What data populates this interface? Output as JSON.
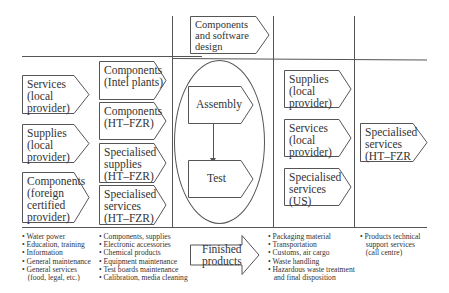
{
  "top": {
    "design_box": "Components\nand software\ndesign"
  },
  "left_column": {
    "boxes": [
      "Services\n(local\nprovider)",
      "Supplies\n(local\nprovider)",
      "Components\n(foreign\ncertified\nprovider)"
    ],
    "list": [
      "• Water power",
      "• Education, training",
      "• Information",
      "• General maintenance",
      "• General services",
      "   (food, legal, etc.)"
    ]
  },
  "second_column": {
    "boxes": [
      "Components\n(Intel plants)",
      "Components\n(HT–FZR)",
      "Specialised\nsupplies\n(HT–FZR)",
      "Specialised\nservices\n(HT–FZR)"
    ],
    "list": [
      "• Components, supplies",
      "• Electronic accessories",
      "• Chemical products",
      "• Equipment maintenance",
      "• Test boards maintenance",
      "• Calibration, media cleaning"
    ]
  },
  "center": {
    "assembly": "Assembly",
    "test": "Test",
    "finished": "Finished\nproducts"
  },
  "fourth_column": {
    "boxes": [
      "Supplies\n(local\nprovider)",
      "Services\n(local\nprovider)",
      "Specialised\nservices\n(US)"
    ],
    "list": [
      "• Packaging material",
      "• Transportation",
      "• Customs, air cargo",
      "• Waste handling",
      "• Hazardous waste treatment",
      "   and final disposition"
    ]
  },
  "right_column": {
    "boxes": [
      "Specialised\nservices\n(HT–FZR"
    ],
    "list": [
      "• Products technical",
      "   support services",
      "   (call centre)"
    ]
  }
}
